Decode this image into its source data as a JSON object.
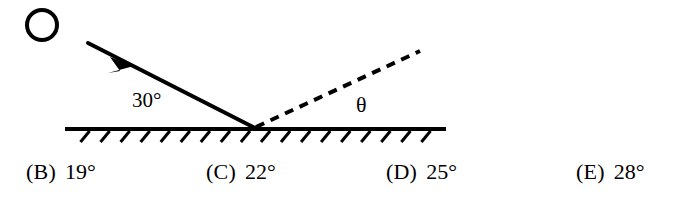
{
  "figure": {
    "background_color": "#ffffff",
    "stroke_color": "#000000",
    "light_source": {
      "icon_name": "open-circle-light-source",
      "center_x": 42,
      "center_y": 25,
      "radius": 15,
      "stroke_width": 4
    },
    "incident_ray": {
      "label": "30°",
      "start_x": 88,
      "start_y": 43,
      "end_x": 255,
      "end_y": 128,
      "stroke_width": 4,
      "arrow_at_x": 127,
      "arrow_at_y": 63,
      "style": "solid"
    },
    "reflected_ray": {
      "label": "θ",
      "start_x": 256,
      "start_y": 127,
      "end_x": 420,
      "end_y": 51,
      "stroke_width": 4,
      "style": "dashed",
      "dash_pattern": "9 7"
    },
    "surface": {
      "name": "hatched-ground-surface",
      "x_start": 65,
      "x_end": 446,
      "y": 129,
      "stroke_width": 4,
      "hatch_count": 18,
      "hatch_length": 12,
      "hatch_stroke_width": 3,
      "hatch_slant": "up-right"
    }
  },
  "answers": {
    "choices": [
      {
        "letter": "(B)",
        "value": "19°"
      },
      {
        "letter": "(C)",
        "value": "22°"
      },
      {
        "letter": "(D)",
        "value": "25°"
      },
      {
        "letter": "(E)",
        "value": "28°"
      }
    ]
  }
}
